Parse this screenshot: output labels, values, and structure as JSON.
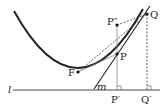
{
  "diagram": {
    "type": "geometry",
    "labels": {
      "focus": "F",
      "point_p": "P",
      "point_p2": "P″",
      "point_q": "Q",
      "proj_p": "P′",
      "proj_q": "Q′",
      "directrix": "l",
      "tangent": "m"
    },
    "colors": {
      "curve": "#222222",
      "lines": "#333333",
      "thin": "#888888"
    }
  }
}
